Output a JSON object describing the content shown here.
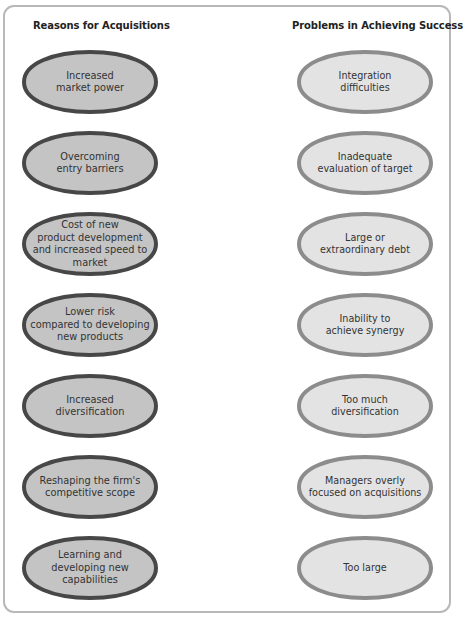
{
  "figure": {
    "columns": [
      {
        "id": "reasons",
        "title": "Reasons for Acquisitions",
        "style": {
          "fill": "#c4c4c4",
          "stroke": "#474747",
          "stroke_width": 4
        },
        "items": [
          {
            "label": "Increased\nmarket power"
          },
          {
            "label": "Overcoming\nentry barriers"
          },
          {
            "label": "Cost of new\nproduct development\nand increased speed to\nmarket"
          },
          {
            "label": "Lower risk\ncompared to developing\nnew products"
          },
          {
            "label": "Increased\ndiversification"
          },
          {
            "label": "Reshaping the firm's\ncompetitive scope"
          },
          {
            "label": "Learning and\ndeveloping new\ncapabilities"
          }
        ]
      },
      {
        "id": "problems",
        "title": "Problems in Achieving Success",
        "style": {
          "fill": "#e3e3e3",
          "stroke": "#8c8c8c",
          "stroke_width": 4
        },
        "items": [
          {
            "label": "Integration\ndifficulties"
          },
          {
            "label": "Inadequate\nevaluation of target"
          },
          {
            "label": "Large or\nextraordinary debt"
          },
          {
            "label": "Inability to\nachieve synergy"
          },
          {
            "label": "Too much\ndiversification"
          },
          {
            "label": "Managers overly\nfocused on acquisitions"
          },
          {
            "label": "Too large"
          }
        ]
      }
    ]
  }
}
